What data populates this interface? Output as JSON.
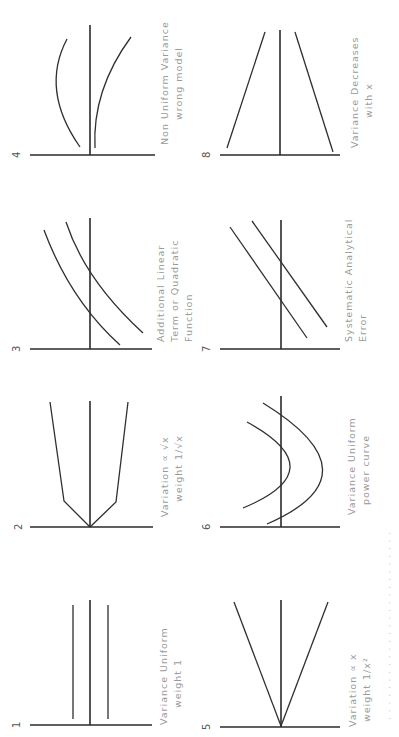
{
  "figure": {
    "orientation": "rotated 90° counter-clockwise",
    "caption_fragment": "(illegible, cut off at page edge)",
    "panels": [
      {
        "id": "1",
        "number": "1",
        "caption_line1": "Variance Uniform",
        "caption_line2": "weight 1",
        "pattern": "horizontal uniform band"
      },
      {
        "id": "2",
        "number": "2",
        "caption_line1": "Variation ∝ √x",
        "caption_line2": "weight 1/√x",
        "pattern": "band widening as square root of x"
      },
      {
        "id": "3",
        "number": "3",
        "caption_line1": "Additional Linear",
        "caption_line2": "Term or Quadratic",
        "caption_line3": "Function",
        "pattern": "curved trend band crossing zero"
      },
      {
        "id": "4",
        "number": "4",
        "caption_line1": "Non Uniform Variance",
        "caption_line2": "wrong model",
        "pattern": "non-uniform curved band"
      },
      {
        "id": "5",
        "number": "5",
        "caption_line1": "Variation ∝ x",
        "caption_line2": "weight 1/x²",
        "pattern": "linear funnel widening from origin"
      },
      {
        "id": "6",
        "number": "6",
        "caption_line1": "Variance Uniform",
        "caption_line2": "power curve",
        "pattern": "parabolic band"
      },
      {
        "id": "7",
        "number": "7",
        "caption_line1": "Systematic Analytical",
        "caption_line2": "Error",
        "pattern": "parallel sloped lines"
      },
      {
        "id": "8",
        "number": "8",
        "caption_line1": "Variance Decreases",
        "caption_line2": "with x",
        "pattern": "funnel narrowing with x"
      }
    ]
  }
}
